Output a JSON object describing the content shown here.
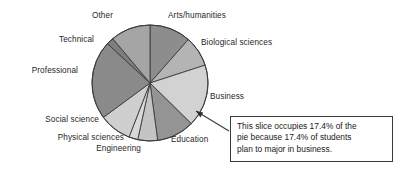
{
  "chart_data": {
    "type": "pie",
    "title": "",
    "xlabel": "",
    "ylabel": "",
    "legend_position": "none",
    "grid": false,
    "center": {
      "x": 150,
      "y": 83
    },
    "radius": 58,
    "start_angle_deg": 0,
    "direction": "clockwise",
    "categories": [
      "Arts/humanities",
      "Biological sciences",
      "Business",
      "Education",
      "Engineering",
      "Physical sciences",
      "Social science",
      "Professional",
      "Technical",
      "Other"
    ],
    "values": [
      11.5,
      8.5,
      17.4,
      10.5,
      5.5,
      2.5,
      9.0,
      22.0,
      2.0,
      11.1
    ],
    "slices": [
      {
        "label": "Arts/humanities",
        "percent": 11.5,
        "color": "#8d8d8d",
        "start_deg": 0,
        "end_deg": 41.4
      },
      {
        "label": "Biological sciences",
        "percent": 8.5,
        "color": "#b4b4b4",
        "start_deg": 41.4,
        "end_deg": 72.0
      },
      {
        "label": "Business",
        "percent": 17.4,
        "color": "#d2d2d2",
        "start_deg": 72.0,
        "end_deg": 134.6
      },
      {
        "label": "Education",
        "percent": 10.5,
        "color": "#949494",
        "start_deg": 134.6,
        "end_deg": 172.4
      },
      {
        "label": "Engineering",
        "percent": 5.5,
        "color": "#c4c4c4",
        "start_deg": 172.4,
        "end_deg": 192.2
      },
      {
        "label": "Physical sciences",
        "percent": 2.5,
        "color": "#d8d8d8",
        "start_deg": 192.2,
        "end_deg": 201.2
      },
      {
        "label": "Social science",
        "percent": 9.0,
        "color": "#cfcfcf",
        "start_deg": 201.2,
        "end_deg": 233.6
      },
      {
        "label": "Professional",
        "percent": 22.0,
        "color": "#8a8a8a",
        "start_deg": 233.6,
        "end_deg": 312.8
      },
      {
        "label": "Technical",
        "percent": 2.0,
        "color": "#7e7e7e",
        "start_deg": 312.8,
        "end_deg": 320.0
      },
      {
        "label": "Other",
        "percent": 11.1,
        "color": "#a5a5a5",
        "start_deg": 320.0,
        "end_deg": 360.0
      }
    ],
    "annotations": [
      {
        "name": "business-callout",
        "lines": [
          "This slice occupies 17.4% of the",
          "pie because 17.4% of students",
          "plan to major in business."
        ],
        "points_to": "Business"
      }
    ]
  },
  "labels": {
    "arts_humanities": "Arts/humanities",
    "biological_sciences": "Biological sciences",
    "business": "Business",
    "education": "Education",
    "engineering": "Engineering",
    "physical_sciences": "Physical sciences",
    "social_science": "Social science",
    "professional": "Professional",
    "technical": "Technical",
    "other": "Other"
  },
  "callout": {
    "line1": "This slice occupies 17.4% of the",
    "line2": "pie because 17.4% of students",
    "line3": "plan to major in business."
  },
  "colors": {
    "slice_stroke": "#3c3c3c",
    "callout_border": "#3a3a3a",
    "text": "#1a1a1a",
    "leader_line": "#3a3a3a"
  }
}
